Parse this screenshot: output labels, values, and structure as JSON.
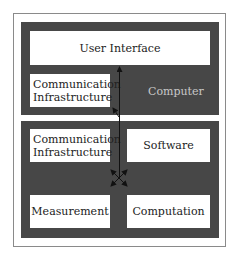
{
  "diagram": {
    "computer_block": {
      "label": "Computer",
      "user_interface": "User Interface",
      "communication": "Communication Infrastructure"
    },
    "device_block": {
      "communication": "Communication Infrastructure",
      "software": "Software",
      "measurement": "Measurement",
      "computation": "Computation"
    },
    "colors": {
      "block": "#474747",
      "box": "#ffffff",
      "frame": "#8a8a8a",
      "arrow": "#111111"
    }
  }
}
